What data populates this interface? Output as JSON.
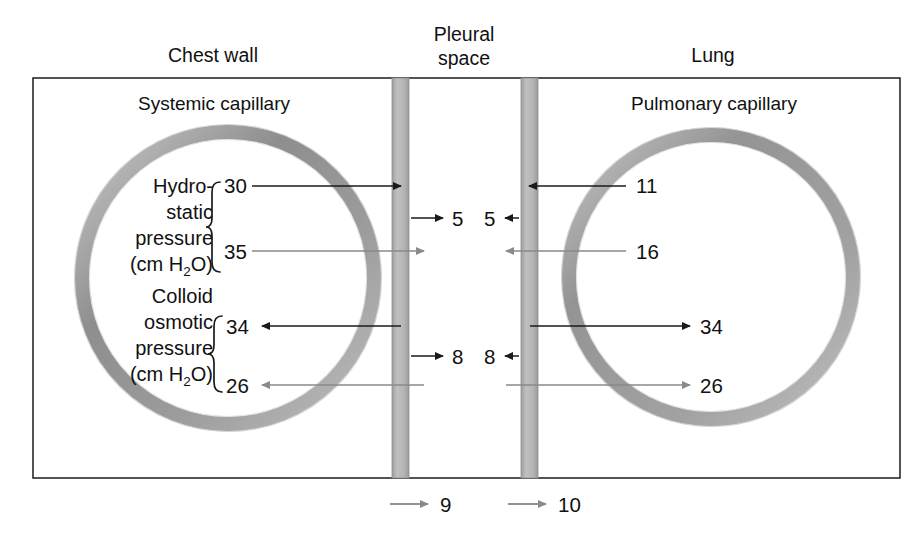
{
  "figure": {
    "type": "physiology-diagram",
    "headers": {
      "left": "Chest wall",
      "center_line1": "Pleural",
      "center_line2": "space",
      "right": "Lung"
    },
    "inner_labels": {
      "left_capillary": "Systemic capillary",
      "right_capillary": "Pulmonary capillary"
    },
    "left_capillary": {
      "groups": [
        {
          "name": "hydrostatic",
          "label_lines": [
            "Hydro-",
            "static",
            "pressure"
          ],
          "units_prefix": "(cm H",
          "units_sub": "2",
          "units_suffix": "O)",
          "values": [
            "30",
            "35"
          ]
        },
        {
          "name": "colloid-osmotic",
          "label_lines": [
            "Colloid",
            "osmotic",
            "pressure"
          ],
          "units_prefix": "(cm H",
          "units_sub": "2",
          "units_suffix": "O)",
          "values": [
            "34",
            "26"
          ]
        }
      ]
    },
    "right_capillary": {
      "values": {
        "hydrostatic_top": "11",
        "hydrostatic_bottom": "16",
        "colloid_top": "34",
        "colloid_bottom": "26"
      }
    },
    "pleural_space": {
      "net_hydrostatic_left": "5",
      "net_hydrostatic_right": "5",
      "net_colloid_left": "8",
      "net_colloid_right": "8"
    },
    "bottom_flows": {
      "left": "9",
      "right": "10"
    },
    "colors": {
      "frame_stroke": "#2a2a2a",
      "membrane_fill": "#b4b4b4",
      "membrane_stroke": "#8f8f8f",
      "vessel_wall_dark": "#8c8c8c",
      "vessel_wall_light": "#c9c9c9",
      "arrow_black": "#1a1a1a",
      "arrow_gray": "#8a8a8a",
      "background": "#ffffff"
    }
  }
}
